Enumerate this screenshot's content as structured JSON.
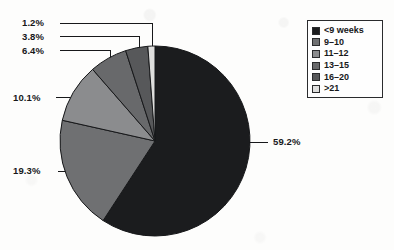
{
  "chart_data": {
    "type": "pie",
    "title": "",
    "subtitle": "",
    "xlabel": "",
    "ylabel": "",
    "legend_position": "top-right",
    "grid": false,
    "units": "percent",
    "start_angle_deg": 0,
    "direction": "clockwise",
    "categories": [
      "<9 weeks",
      "9–10",
      "11–12",
      "13–15",
      "16–20",
      ">21"
    ],
    "values": [
      59.2,
      19.3,
      10.1,
      6.4,
      3.8,
      1.2
    ],
    "labels": [
      "59.2%",
      "19.3%",
      "10.1%",
      "6.4%",
      "3.8%",
      "1.2%"
    ],
    "colors": [
      "#1b1c1e",
      "#6f7072",
      "#8b8c8e",
      "#68696b",
      "#57585a",
      "#dededd"
    ],
    "slices": [
      {
        "label": "<9 weeks",
        "value": 59.2,
        "display": "59.2%",
        "color": "#1b1c1e"
      },
      {
        "label": "9–10",
        "value": 19.3,
        "display": "19.3%",
        "color": "#6f7072"
      },
      {
        "label": "11–12",
        "value": 10.1,
        "display": "10.1%",
        "color": "#8b8c8e"
      },
      {
        "label": "13–15",
        "value": 6.4,
        "display": "6.4%",
        "color": "#68696b"
      },
      {
        "label": "16–20",
        "value": 3.8,
        "display": "3.8%",
        "color": "#57585a"
      },
      {
        "label": ">21",
        "value": 1.2,
        "display": "1.2%",
        "color": "#dededd"
      }
    ]
  },
  "legend": {
    "items": [
      {
        "label": "<9 weeks",
        "color": "#1b1c1e"
      },
      {
        "label": "9–10",
        "color": "#6f7072"
      },
      {
        "label": "11–12",
        "color": "#8b8c8e"
      },
      {
        "label": "13–15",
        "color": "#68696b"
      },
      {
        "label": "16–20",
        "color": "#57585a"
      },
      {
        "label": ">21",
        "color": "#dededd"
      }
    ]
  },
  "callouts": {
    "c1": "1.2%",
    "c2": "3.8%",
    "c3": "6.4%",
    "c4": "10.1%",
    "c5": "19.3%",
    "c6": "59.2%"
  },
  "style": {
    "background": "#fdfdfc",
    "stroke": "#17181a",
    "text": "#17181a"
  }
}
